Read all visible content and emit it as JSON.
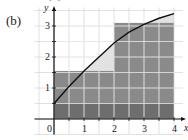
{
  "panel_label": "(b)",
  "top_cut_text": "i=1",
  "chart_data": {
    "type": "area",
    "title": "",
    "xlabel": "x",
    "ylabel": "y",
    "xlim": [
      0,
      4
    ],
    "ylim": [
      0,
      3.5
    ],
    "grid": true,
    "grid_step": 0.5,
    "x_ticks": [
      "0",
      "1",
      "2",
      "3",
      "4"
    ],
    "y_ticks": [
      "1",
      "2",
      "3"
    ],
    "curve": {
      "x": [
        0,
        0.5,
        1,
        1.5,
        2,
        2.5,
        3,
        3.5,
        4
      ],
      "y": [
        0.5,
        1.05,
        1.55,
        2.0,
        2.45,
        2.8,
        3.05,
        3.25,
        3.4
      ]
    },
    "rectangles": [
      {
        "x0": 0,
        "x1": 2,
        "height": 1.55
      },
      {
        "x0": 2,
        "x1": 4,
        "height": 3.1
      }
    ],
    "colors": {
      "rect_fill": "#8a8a8a",
      "base_band": "#6e6e6e",
      "under_curve_fill": "#e2e2e2",
      "curve": "#111111",
      "grid": "#ffffff"
    }
  }
}
